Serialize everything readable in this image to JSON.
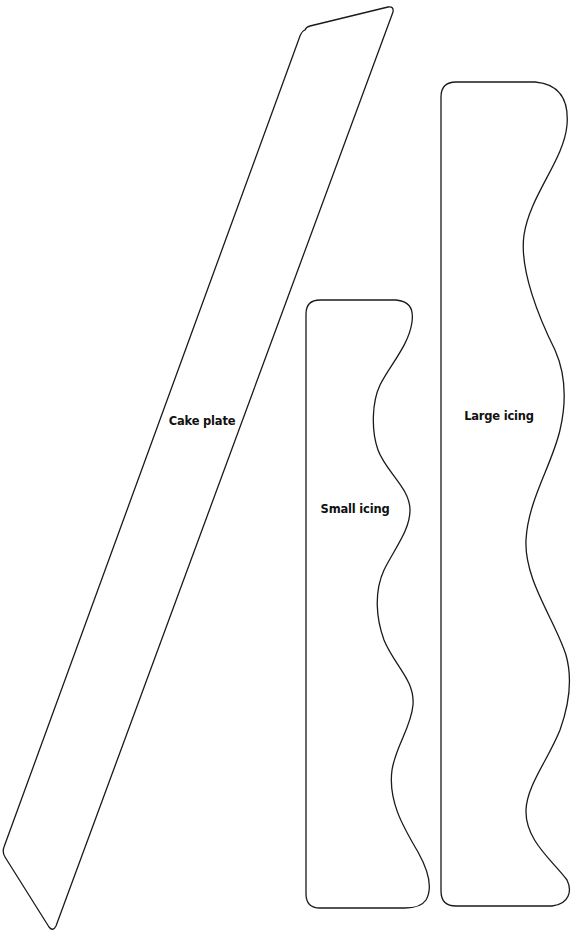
{
  "template": {
    "pieces": [
      {
        "id": "cake-plate",
        "label": "Cake plate",
        "shape": "parallelogram",
        "label_pos": {
          "x": 202,
          "y": 421
        }
      },
      {
        "id": "small-icing",
        "label": "Small icing",
        "shape": "strip-with-wavy-right-edge",
        "label_pos": {
          "x": 355,
          "y": 509
        }
      },
      {
        "id": "large-icing",
        "label": "Large icing",
        "shape": "strip-with-wavy-right-edge",
        "label_pos": {
          "x": 499,
          "y": 416
        }
      }
    ]
  },
  "colors": {
    "background": "#ffffff",
    "outline": "#1a1a1a",
    "text": "#111111"
  }
}
